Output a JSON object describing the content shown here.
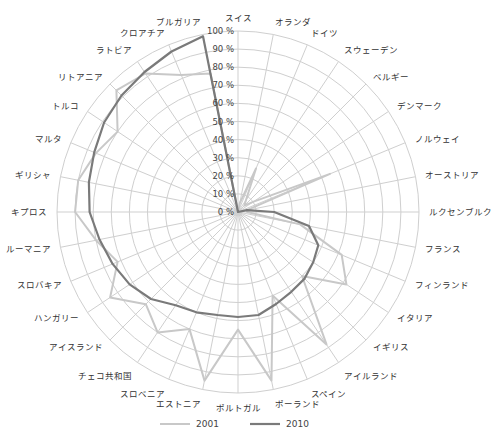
{
  "chart_data": {
    "type": "radar",
    "title": "",
    "categories": [
      "スイス",
      "オランダ",
      "ドイツ",
      "スウェーデン",
      "ベルギー",
      "デンマーク",
      "ノルウェイ",
      "オーストリア",
      "ルクセンブルク",
      "フランス",
      "フィンランド",
      "イタリア",
      "イギリス",
      "アイルランド",
      "スペイン",
      "ポーランド",
      "ポルトガル",
      "エストニア",
      "スロベニア",
      "チェコ共和国",
      "アイスランド",
      "ハンガリー",
      "スロバキア",
      "ルーマニア",
      "キプロス",
      "ギリシャ",
      "マルタ",
      "トルコ",
      "リトアニア",
      "ラトビア",
      "クロアチア",
      "ブルガリア"
    ],
    "series": [
      {
        "name": "2001",
        "color": "#c8c8c8",
        "width": 2,
        "values": [
          0,
          5,
          26,
          8,
          5,
          10,
          55,
          5,
          5,
          35,
          62,
          72,
          50,
          88,
          50,
          95,
          65,
          95,
          70,
          80,
          72,
          85,
          72,
          80,
          90,
          90,
          85,
          80,
          95,
          92,
          82,
          78
        ]
      },
      {
        "name": "2010",
        "color": "#7a7a7a",
        "width": 2.2,
        "values": [
          0,
          0,
          0,
          0,
          0,
          0,
          0,
          5,
          20,
          40,
          48,
          50,
          52,
          53,
          55,
          58,
          58,
          58,
          60,
          62,
          68,
          72,
          75,
          78,
          82,
          84,
          86,
          89,
          91,
          93,
          96,
          99
        ]
      }
    ],
    "r_ticks": [
      "0 %",
      "10 %",
      "20 %",
      "30 %",
      "40 %",
      "50 %",
      "60 %",
      "70 %",
      "80 %",
      "90 %",
      "100 %"
    ],
    "rlim": [
      0,
      100
    ],
    "grid": true,
    "legend_position": "bottom"
  },
  "legend": [
    {
      "label": "2001"
    },
    {
      "label": "2010"
    }
  ]
}
